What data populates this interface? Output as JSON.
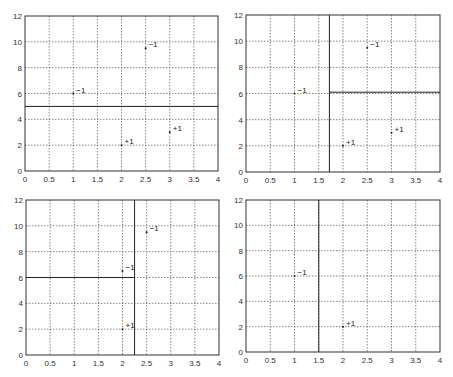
{
  "chart_data": [
    {
      "type": "scatter",
      "title": "",
      "xlabel": "",
      "ylabel": "",
      "xlim": [
        0,
        4
      ],
      "ylim": [
        0,
        12
      ],
      "xticks": [
        "0",
        "0.5",
        "1",
        "1.5",
        "2",
        "2.5",
        "3",
        "3.5",
        "4"
      ],
      "yticks": [
        "0",
        "2",
        "4",
        "6",
        "8",
        "10",
        "12"
      ],
      "grid": true,
      "points": [
        {
          "x": 1,
          "y": 6,
          "label": "−1"
        },
        {
          "x": 2.5,
          "y": 9.5,
          "label": "−1"
        },
        {
          "x": 2,
          "y": 2,
          "label": "+1"
        },
        {
          "x": 3,
          "y": 3,
          "label": "+1"
        }
      ],
      "boundaries": [
        {
          "x1": 0,
          "y1": 5,
          "x2": 4,
          "y2": 5
        }
      ],
      "frame": {
        "left": 25,
        "top": 16,
        "right": 218,
        "bottom": 171
      }
    },
    {
      "type": "scatter",
      "title": "",
      "xlabel": "",
      "ylabel": "",
      "xlim": [
        0,
        4
      ],
      "ylim": [
        0,
        12
      ],
      "xticks": [
        "0",
        "0.5",
        "1",
        "1.5",
        "2",
        "2.5",
        "3",
        "3.5",
        "4"
      ],
      "yticks": [
        "0",
        "2",
        "4",
        "6",
        "8",
        "10",
        "12"
      ],
      "grid": true,
      "points": [
        {
          "x": 1,
          "y": 6,
          "label": "−1"
        },
        {
          "x": 2.5,
          "y": 9.5,
          "label": "−1"
        },
        {
          "x": 2,
          "y": 2,
          "label": "+1"
        },
        {
          "x": 3,
          "y": 3,
          "label": "+1"
        }
      ],
      "boundaries": [
        {
          "x1": 1.72,
          "y1": 0,
          "x2": 1.72,
          "y2": 12
        },
        {
          "x1": 1.72,
          "y1": 6.1,
          "x2": 4,
          "y2": 6.1
        }
      ],
      "frame": {
        "left": 246,
        "top": 15,
        "right": 440,
        "bottom": 172
      }
    },
    {
      "type": "scatter",
      "title": "",
      "xlabel": "",
      "ylabel": "",
      "xlim": [
        0,
        4
      ],
      "ylim": [
        0,
        12
      ],
      "xticks": [
        "0",
        "0.5",
        "1",
        "1.5",
        "2",
        "2.5",
        "3",
        "3.5",
        "4"
      ],
      "yticks": [
        "0",
        "2",
        "4",
        "6",
        "8",
        "10",
        "12"
      ],
      "grid": true,
      "points": [
        {
          "x": 2,
          "y": 6.5,
          "label": "−1"
        },
        {
          "x": 2.5,
          "y": 9.5,
          "label": "−1"
        },
        {
          "x": 2,
          "y": 2,
          "label": "+1"
        }
      ],
      "boundaries": [
        {
          "x1": 2.25,
          "y1": 0,
          "x2": 2.25,
          "y2": 12
        },
        {
          "x1": 0,
          "y1": 6,
          "x2": 2.25,
          "y2": 6
        }
      ],
      "frame": {
        "left": 26,
        "top": 200,
        "right": 219,
        "bottom": 355
      }
    },
    {
      "type": "scatter",
      "title": "",
      "xlabel": "",
      "ylabel": "",
      "xlim": [
        0,
        4
      ],
      "ylim": [
        0,
        12
      ],
      "xticks": [
        "0",
        "0.5",
        "1",
        "1.5",
        "2",
        "2.5",
        "3",
        "3.5",
        "4"
      ],
      "yticks": [
        "0",
        "2",
        "4",
        "6",
        "8",
        "10",
        "12"
      ],
      "grid": true,
      "points": [
        {
          "x": 1,
          "y": 6,
          "label": "−1"
        },
        {
          "x": 2,
          "y": 2,
          "label": "+1"
        }
      ],
      "boundaries": [
        {
          "x1": 1.5,
          "y1": 0,
          "x2": 1.5,
          "y2": 12
        }
      ],
      "frame": {
        "left": 246,
        "top": 200,
        "right": 440,
        "bottom": 352
      }
    }
  ]
}
